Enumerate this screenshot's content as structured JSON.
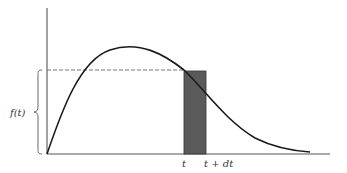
{
  "figure": {
    "type": "probability-density-diagram",
    "y_label": "f(t)",
    "x_labels": {
      "t": "t",
      "t_plus_dt": "t + dt"
    },
    "colors": {
      "curve": "#1a1a1a",
      "axis": "#444444",
      "dashed": "#666666",
      "bar_fill": "#5a5a5a"
    }
  }
}
